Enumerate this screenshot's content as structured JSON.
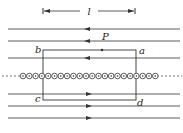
{
  "diagram": {
    "length_label": "l",
    "point_label": "P",
    "corners": {
      "a": "a",
      "b": "b",
      "c": "c",
      "d": "d"
    },
    "upper_lines": [
      {
        "y": 29,
        "direction": "left"
      },
      {
        "y": 41,
        "direction": "left"
      },
      {
        "y": 58,
        "direction": "left"
      }
    ],
    "lower_lines": [
      {
        "y": 94,
        "direction": "right"
      },
      {
        "y": 106,
        "direction": "right"
      },
      {
        "y": 118,
        "direction": "right"
      }
    ],
    "current_row": {
      "y": 76,
      "count": 22,
      "symbol": "dot-in-circle (out of page)"
    },
    "colors": {
      "line": "#333333",
      "background": "#ffffff"
    }
  }
}
